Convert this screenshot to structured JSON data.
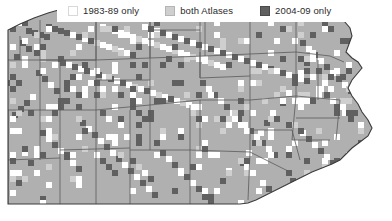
{
  "figure": {
    "width": 392,
    "height": 221
  },
  "legend": {
    "position": "top",
    "background": "#ffffff",
    "entries": [
      {
        "id": "first-atlas-only",
        "label": "1983-89 only",
        "color": "#ffffff",
        "swatch_border": "#d8d8d8"
      },
      {
        "id": "both-atlases",
        "label": "both Atlases",
        "color": "#cfcfcf",
        "swatch_border": "#b4b4b4"
      },
      {
        "id": "second-atlas-only",
        "label": "2004-09 only",
        "color": "#606060",
        "swatch_border": "#4a4a4a"
      }
    ]
  },
  "map": {
    "region": "Pennsylvania",
    "land_fill": "#b0b0b0",
    "water_fill": "#ffffff",
    "county_line": "#5a5a5a",
    "state_line": "#3c3c3c",
    "background": "#ffffff"
  },
  "chart_data": {
    "type": "heatmap",
    "xlabel": "",
    "ylabel": "",
    "legend_position": "top",
    "grid": true,
    "categories": [
      "1983-89 only",
      "both Atlases",
      "2004-09 only"
    ],
    "category_colors": [
      "#ffffff",
      "#cfcfcf",
      "#606060"
    ],
    "cell_size": 6,
    "blocks": [
      [
        46,
        24,
        2
      ],
      [
        52,
        26,
        2
      ],
      [
        58,
        28,
        2
      ],
      [
        64,
        30,
        2
      ],
      [
        70,
        32,
        0
      ],
      [
        76,
        34,
        2
      ],
      [
        82,
        36,
        0
      ],
      [
        88,
        38,
        2
      ],
      [
        94,
        40,
        1
      ],
      [
        100,
        42,
        0
      ],
      [
        106,
        44,
        0
      ],
      [
        112,
        46,
        1
      ],
      [
        118,
        48,
        0
      ],
      [
        124,
        50,
        0
      ],
      [
        130,
        52,
        2
      ],
      [
        26,
        28,
        2
      ],
      [
        32,
        30,
        2
      ],
      [
        38,
        32,
        2
      ],
      [
        44,
        34,
        2
      ],
      [
        20,
        40,
        2
      ],
      [
        26,
        46,
        2
      ],
      [
        14,
        54,
        2
      ],
      [
        100,
        24,
        0
      ],
      [
        106,
        26,
        1
      ],
      [
        112,
        28,
        0
      ],
      [
        118,
        30,
        0
      ],
      [
        124,
        32,
        0
      ],
      [
        130,
        34,
        0
      ],
      [
        136,
        36,
        1
      ],
      [
        142,
        38,
        0
      ],
      [
        148,
        40,
        0
      ],
      [
        154,
        42,
        1
      ],
      [
        160,
        44,
        0
      ],
      [
        166,
        46,
        0
      ],
      [
        172,
        48,
        1
      ],
      [
        178,
        50,
        0
      ],
      [
        184,
        52,
        0
      ],
      [
        190,
        54,
        1
      ],
      [
        196,
        56,
        0
      ],
      [
        202,
        58,
        0
      ],
      [
        208,
        60,
        1
      ],
      [
        214,
        62,
        0
      ],
      [
        220,
        64,
        0
      ],
      [
        142,
        24,
        0
      ],
      [
        148,
        26,
        2
      ],
      [
        154,
        28,
        0
      ],
      [
        160,
        30,
        2
      ],
      [
        166,
        32,
        0
      ],
      [
        172,
        34,
        2
      ],
      [
        178,
        36,
        0
      ],
      [
        184,
        38,
        2
      ],
      [
        190,
        40,
        0
      ],
      [
        196,
        42,
        2
      ],
      [
        202,
        44,
        0
      ],
      [
        208,
        46,
        2
      ],
      [
        214,
        48,
        0
      ],
      [
        220,
        50,
        2
      ],
      [
        226,
        52,
        0
      ],
      [
        232,
        54,
        2
      ],
      [
        238,
        56,
        0
      ],
      [
        244,
        58,
        2
      ],
      [
        250,
        60,
        0
      ],
      [
        256,
        62,
        2
      ],
      [
        262,
        64,
        0
      ],
      [
        268,
        66,
        2
      ],
      [
        274,
        68,
        0
      ],
      [
        280,
        70,
        2
      ],
      [
        286,
        72,
        0
      ],
      [
        292,
        74,
        2
      ],
      [
        298,
        76,
        0
      ],
      [
        304,
        78,
        2
      ],
      [
        60,
        60,
        2
      ],
      [
        66,
        62,
        0
      ],
      [
        72,
        64,
        2
      ],
      [
        78,
        66,
        0
      ],
      [
        84,
        68,
        2
      ],
      [
        90,
        70,
        0
      ],
      [
        96,
        72,
        2
      ],
      [
        102,
        74,
        0
      ],
      [
        108,
        76,
        2
      ],
      [
        114,
        78,
        0
      ],
      [
        120,
        80,
        2
      ],
      [
        126,
        82,
        0
      ],
      [
        132,
        84,
        1
      ],
      [
        138,
        86,
        0
      ],
      [
        144,
        88,
        2
      ],
      [
        150,
        90,
        0
      ],
      [
        156,
        92,
        1
      ],
      [
        162,
        94,
        0
      ],
      [
        168,
        96,
        2
      ],
      [
        174,
        98,
        0
      ],
      [
        180,
        100,
        1
      ],
      [
        186,
        102,
        0
      ],
      [
        36,
        70,
        2
      ],
      [
        42,
        76,
        2
      ],
      [
        48,
        82,
        0
      ],
      [
        54,
        88,
        2
      ],
      [
        30,
        94,
        0
      ],
      [
        24,
        100,
        2
      ],
      [
        18,
        106,
        2
      ],
      [
        12,
        112,
        2
      ],
      [
        200,
        80,
        2
      ],
      [
        206,
        86,
        0
      ],
      [
        212,
        92,
        2
      ],
      [
        218,
        98,
        0
      ],
      [
        224,
        104,
        2
      ],
      [
        230,
        110,
        0
      ],
      [
        236,
        116,
        2
      ],
      [
        242,
        122,
        0
      ],
      [
        248,
        128,
        2
      ],
      [
        254,
        134,
        0
      ],
      [
        260,
        140,
        2
      ],
      [
        266,
        146,
        0
      ],
      [
        272,
        152,
        2
      ],
      [
        300,
        40,
        2
      ],
      [
        306,
        46,
        0
      ],
      [
        312,
        52,
        2
      ],
      [
        318,
        58,
        0
      ],
      [
        324,
        64,
        2
      ],
      [
        330,
        70,
        0
      ],
      [
        336,
        76,
        2
      ],
      [
        342,
        82,
        0
      ],
      [
        348,
        88,
        2
      ],
      [
        354,
        94,
        0
      ],
      [
        360,
        100,
        2
      ],
      [
        366,
        106,
        0
      ],
      [
        372,
        112,
        2
      ],
      [
        80,
        120,
        2
      ],
      [
        86,
        126,
        0
      ],
      [
        92,
        132,
        2
      ],
      [
        98,
        138,
        0
      ],
      [
        104,
        144,
        2
      ],
      [
        110,
        150,
        0
      ],
      [
        116,
        156,
        2
      ],
      [
        122,
        162,
        0
      ],
      [
        128,
        168,
        2
      ],
      [
        134,
        174,
        0
      ],
      [
        140,
        180,
        2
      ],
      [
        146,
        186,
        0
      ],
      [
        152,
        192,
        2
      ],
      [
        40,
        130,
        2
      ],
      [
        46,
        136,
        0
      ],
      [
        52,
        142,
        2
      ],
      [
        58,
        148,
        0
      ],
      [
        64,
        154,
        2
      ],
      [
        70,
        160,
        0
      ],
      [
        76,
        166,
        2
      ],
      [
        22,
        150,
        0
      ],
      [
        28,
        160,
        2
      ],
      [
        34,
        170,
        0
      ],
      [
        16,
        180,
        2
      ],
      [
        10,
        190,
        0
      ],
      [
        40,
        196,
        2
      ],
      [
        160,
        150,
        2
      ],
      [
        166,
        156,
        0
      ],
      [
        172,
        162,
        2
      ],
      [
        178,
        168,
        0
      ],
      [
        184,
        174,
        2
      ],
      [
        190,
        180,
        0
      ],
      [
        196,
        186,
        2
      ],
      [
        202,
        192,
        0
      ],
      [
        208,
        198,
        2
      ],
      [
        214,
        188,
        0
      ],
      [
        220,
        178,
        2
      ],
      [
        226,
        168,
        0
      ],
      [
        240,
        160,
        2
      ],
      [
        246,
        150,
        0
      ],
      [
        252,
        140,
        2
      ],
      [
        258,
        130,
        0
      ],
      [
        264,
        120,
        2
      ],
      [
        270,
        110,
        0
      ],
      [
        280,
        100,
        2
      ],
      [
        286,
        90,
        0
      ],
      [
        292,
        80,
        2
      ],
      [
        298,
        70,
        0
      ],
      [
        304,
        60,
        2
      ],
      [
        310,
        50,
        0
      ],
      [
        318,
        86,
        0
      ],
      [
        324,
        92,
        2
      ],
      [
        330,
        98,
        0
      ],
      [
        336,
        104,
        2
      ],
      [
        342,
        110,
        0
      ],
      [
        348,
        116,
        2
      ],
      [
        300,
        130,
        0
      ],
      [
        306,
        136,
        2
      ],
      [
        312,
        142,
        0
      ],
      [
        318,
        148,
        2
      ],
      [
        324,
        154,
        0
      ],
      [
        330,
        160,
        2
      ],
      [
        260,
        180,
        0
      ],
      [
        266,
        186,
        2
      ],
      [
        272,
        192,
        0
      ],
      [
        278,
        198,
        2
      ],
      [
        284,
        188,
        0
      ],
      [
        290,
        178,
        2
      ]
    ]
  }
}
